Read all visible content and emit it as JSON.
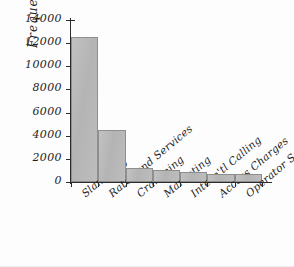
{
  "chart_data": {
    "type": "bar",
    "title": "",
    "xlabel": "",
    "ylabel": "Frequency",
    "ylim": [
      0,
      14000
    ],
    "yticks": [
      "0",
      "2000",
      "4000",
      "6000",
      "8000",
      "10000",
      "12000",
      "14000"
    ],
    "ytick_values": [
      0,
      2000,
      4000,
      6000,
      8000,
      10000,
      12000,
      14000
    ],
    "grid": false,
    "legend": null,
    "categories": [
      "Slamming",
      "Rates and Services",
      "Cramming",
      "Marketing",
      "Intern'tl Calling",
      "Access Charges",
      "Operator Services"
    ],
    "values": [
      12500,
      4500,
      1200,
      1000,
      850,
      700,
      700
    ],
    "bar_color": "#b8b8b8",
    "bar_edge_color": "#8e8e8e",
    "axis_color": "#2b2b2b",
    "background": "#ffffff"
  }
}
